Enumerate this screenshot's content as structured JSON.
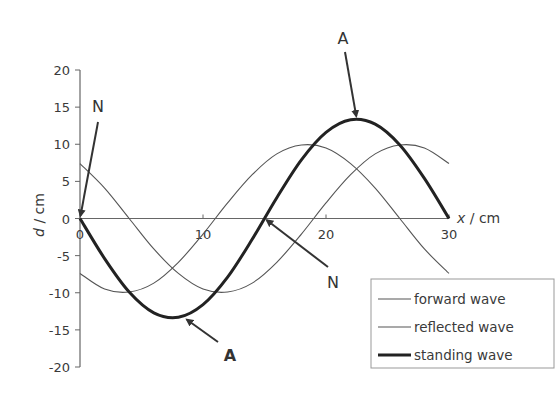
{
  "chart_data": {
    "type": "line",
    "title": "",
    "xlabel": "x / cm",
    "ylabel": "d / cm",
    "xlim": [
      0,
      30
    ],
    "ylim": [
      -20,
      20
    ],
    "xticks": [
      0,
      10,
      20,
      30
    ],
    "xtick_labels": [
      "0",
      "10",
      "20",
      "30"
    ],
    "yticks": [
      20,
      15,
      10,
      5,
      0,
      -5,
      -10,
      -15,
      -20
    ],
    "ytick_labels": [
      "20",
      "15",
      "10",
      "5",
      "0",
      "-5",
      "-10",
      "-15",
      "-20"
    ],
    "grid": false,
    "legend_position": "bottom-right",
    "series": [
      {
        "name": "forward wave",
        "style": "thin",
        "color": "#555555",
        "x": [
          0,
          2,
          4,
          6,
          8,
          10,
          12,
          14,
          16,
          18,
          20,
          22,
          24,
          26,
          28,
          30
        ],
        "values": [
          -7.4,
          -9.5,
          -9.9,
          -8.7,
          -5.9,
          -2.1,
          2.1,
          5.9,
          8.7,
          9.9,
          9.5,
          7.4,
          4.1,
          0.0,
          -4.1,
          -7.4
        ]
      },
      {
        "name": "reflected wave",
        "style": "thin",
        "color": "#555555",
        "x": [
          0,
          2,
          4,
          6,
          8,
          10,
          12,
          14,
          16,
          18,
          20,
          22,
          24,
          26,
          28,
          30
        ],
        "values": [
          7.4,
          4.1,
          0.0,
          -4.1,
          -7.4,
          -9.5,
          -9.9,
          -8.7,
          -5.9,
          -2.1,
          2.1,
          5.9,
          8.7,
          9.9,
          9.5,
          7.4
        ]
      },
      {
        "name": "standing wave",
        "style": "thick",
        "color": "#222222",
        "x": [
          0,
          2,
          4,
          6,
          8,
          10,
          12,
          14,
          16,
          18,
          20,
          22,
          24,
          26,
          28,
          30
        ],
        "values": [
          0.0,
          -5.4,
          -9.9,
          -12.7,
          -13.3,
          -11.6,
          -7.9,
          -2.8,
          2.8,
          7.9,
          11.6,
          13.3,
          12.7,
          9.9,
          5.4,
          0.0
        ]
      }
    ],
    "annotations": [
      {
        "label": "N",
        "points_to": [
          0,
          0
        ],
        "bold": false
      },
      {
        "label": "A",
        "points_to": [
          22.5,
          13.4
        ],
        "bold": false
      },
      {
        "label": "N",
        "points_to": [
          15,
          0
        ],
        "bold": false
      },
      {
        "label": "A",
        "points_to": [
          8.5,
          -13.4
        ],
        "bold": true
      }
    ]
  }
}
